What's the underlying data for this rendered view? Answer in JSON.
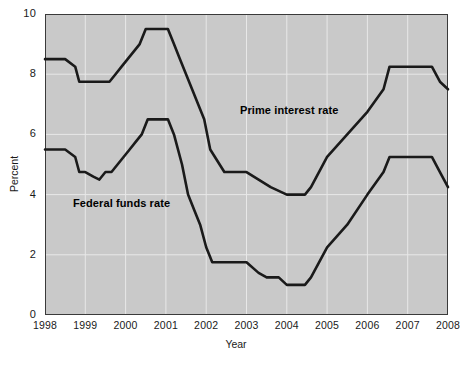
{
  "chart_data": {
    "type": "line",
    "title": "",
    "xlabel": "Year",
    "ylabel": "Percent",
    "xlim": [
      1998,
      2008
    ],
    "ylim": [
      0,
      10
    ],
    "grid": true,
    "legend_position": "inline-annotations",
    "background_color": "#c9c9c9",
    "line_color": "#1a1a1a",
    "y_ticks": [
      0,
      2,
      4,
      6,
      8,
      10
    ],
    "y_tick_labels": [
      "0",
      "2",
      "4",
      "6",
      "8",
      "10"
    ],
    "x_ticks": [
      1998,
      1999,
      2000,
      2001,
      2002,
      2003,
      2004,
      2005,
      2006,
      2007,
      2008
    ],
    "x_tick_labels": [
      "1998",
      "1999",
      "2000",
      "2001",
      "2002",
      "2003",
      "2004",
      "2005",
      "2006",
      "2007",
      "2008"
    ],
    "annotations": [
      {
        "name": "prime-interest-rate-label",
        "text": "Prime interest rate",
        "x": 2002.6,
        "y": 7.0
      },
      {
        "name": "federal-funds-rate-label",
        "text": "Federal funds rate",
        "x": 1998.8,
        "y": 3.9
      }
    ],
    "series": [
      {
        "name": "Prime interest rate",
        "color": "#1a1a1a",
        "x": [
          1998.0,
          1998.5,
          1998.75,
          1998.85,
          1999.0,
          1999.4,
          1999.6,
          1999.75,
          1999.9,
          2000.05,
          2000.2,
          2000.35,
          2000.5,
          2000.95,
          2001.05,
          2001.2,
          2001.35,
          2001.5,
          2001.65,
          2001.8,
          2001.95,
          2002.1,
          2002.45,
          2002.6,
          2003.0,
          2003.3,
          2003.6,
          2004.0,
          2004.45,
          2004.6,
          2005.0,
          2005.5,
          2006.0,
          2006.4,
          2006.55,
          2007.0,
          2007.4,
          2007.6,
          2007.8,
          2008.0
        ],
        "y": [
          8.5,
          8.5,
          8.25,
          7.75,
          7.75,
          7.75,
          7.75,
          8.0,
          8.25,
          8.5,
          8.75,
          9.0,
          9.5,
          9.5,
          9.5,
          9.0,
          8.5,
          8.0,
          7.5,
          7.0,
          6.5,
          5.5,
          4.75,
          4.75,
          4.75,
          4.5,
          4.25,
          4.0,
          4.0,
          4.25,
          5.25,
          6.0,
          6.75,
          7.5,
          8.25,
          8.25,
          8.25,
          8.25,
          7.75,
          7.5
        ]
      },
      {
        "name": "Federal funds rate",
        "color": "#1a1a1a",
        "x": [
          1998.0,
          1998.3,
          1998.5,
          1998.75,
          1998.85,
          1999.0,
          1999.2,
          1999.35,
          1999.5,
          1999.65,
          1999.8,
          1999.95,
          2000.1,
          2000.25,
          2000.4,
          2000.55,
          2000.95,
          2001.05,
          2001.2,
          2001.4,
          2001.55,
          2001.7,
          2001.85,
          2002.0,
          2002.15,
          2002.45,
          2002.6,
          2003.0,
          2003.3,
          2003.5,
          2003.8,
          2004.0,
          2004.45,
          2004.6,
          2005.0,
          2005.5,
          2006.0,
          2006.4,
          2006.55,
          2007.0,
          2007.4,
          2007.6,
          2007.8,
          2008.0
        ],
        "y": [
          5.5,
          5.5,
          5.5,
          5.25,
          4.75,
          4.75,
          4.6,
          4.5,
          4.75,
          4.75,
          5.0,
          5.25,
          5.5,
          5.75,
          6.0,
          6.5,
          6.5,
          6.5,
          6.0,
          5.0,
          4.0,
          3.5,
          3.0,
          2.25,
          1.75,
          1.75,
          1.75,
          1.75,
          1.4,
          1.25,
          1.25,
          1.0,
          1.0,
          1.25,
          2.25,
          3.0,
          4.0,
          4.75,
          5.25,
          5.25,
          5.25,
          5.25,
          4.75,
          4.25
        ]
      }
    ]
  }
}
